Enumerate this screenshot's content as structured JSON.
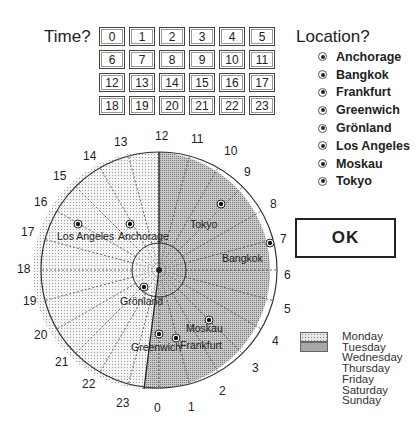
{
  "time": {
    "label": "Time?",
    "hours": [
      "0",
      "1",
      "2",
      "3",
      "4",
      "5",
      "6",
      "7",
      "8",
      "9",
      "10",
      "11",
      "12",
      "13",
      "14",
      "15",
      "16",
      "17",
      "18",
      "19",
      "20",
      "21",
      "22",
      "23"
    ]
  },
  "location": {
    "label": "Location?",
    "options": [
      "Anchorage",
      "Bangkok",
      "Frankfurt",
      "Greenwich",
      "Grönland",
      "Los Angeles",
      "Moskau",
      "Tokyo"
    ]
  },
  "ok_button": {
    "label": "OK"
  },
  "dial": {
    "hour_labels": [
      {
        "text": "12",
        "x": 155,
        "y": 140
      },
      {
        "text": "11",
        "x": 191,
        "y": 143
      },
      {
        "text": "10",
        "x": 224,
        "y": 155
      },
      {
        "text": "9",
        "x": 244,
        "y": 176
      },
      {
        "text": "8",
        "x": 270,
        "y": 208
      },
      {
        "text": "7",
        "x": 280,
        "y": 243
      },
      {
        "text": "6",
        "x": 284,
        "y": 279
      },
      {
        "text": "5",
        "x": 284,
        "y": 313
      },
      {
        "text": "4",
        "x": 272,
        "y": 345
      },
      {
        "text": "3",
        "x": 252,
        "y": 372
      },
      {
        "text": "2",
        "x": 219,
        "y": 395
      },
      {
        "text": "1",
        "x": 188,
        "y": 411
      },
      {
        "text": "0",
        "x": 154,
        "y": 412
      },
      {
        "text": "23",
        "x": 116,
        "y": 407
      },
      {
        "text": "22",
        "x": 82,
        "y": 388
      },
      {
        "text": "21",
        "x": 55,
        "y": 366
      },
      {
        "text": "20",
        "x": 34,
        "y": 339
      },
      {
        "text": "19",
        "x": 23,
        "y": 305
      },
      {
        "text": "18",
        "x": 17,
        "y": 273
      },
      {
        "text": "17",
        "x": 21,
        "y": 236
      },
      {
        "text": "16",
        "x": 34,
        "y": 206
      },
      {
        "text": "15",
        "x": 53,
        "y": 180
      },
      {
        "text": "14",
        "x": 83,
        "y": 160
      },
      {
        "text": "13",
        "x": 114,
        "y": 146
      }
    ],
    "cities": [
      {
        "name": "Los Angeles",
        "mx": 78,
        "my": 224,
        "lx": 57,
        "ly": 240
      },
      {
        "name": "Anchorage",
        "mx": 130,
        "my": 224,
        "lx": 118,
        "ly": 240
      },
      {
        "name": "Tokyo",
        "mx": 221,
        "my": 204,
        "lx": 190,
        "ly": 228
      },
      {
        "name": "Bangkok",
        "mx": 270,
        "my": 243,
        "lx": 222,
        "ly": 262
      },
      {
        "name": "Grönland",
        "mx": 144,
        "my": 287,
        "lx": 120,
        "ly": 305
      },
      {
        "name": "Moskau",
        "mx": 209,
        "my": 320,
        "lx": 186,
        "ly": 332
      },
      {
        "name": "Greenwich",
        "mx": 159,
        "my": 334,
        "lx": 131,
        "ly": 351
      },
      {
        "name": "Frankfurt",
        "mx": 176,
        "my": 338,
        "lx": 180,
        "ly": 349
      }
    ]
  },
  "legend": {
    "swatches": [
      {
        "day": "Monday",
        "color": "#dcdcdc"
      },
      {
        "day": "Tuesday",
        "color": "#9a9a9a"
      }
    ],
    "days": [
      "Monday",
      "Tuesday",
      "Wednesday",
      "Thursday",
      "Friday",
      "Saturday",
      "Sunday"
    ]
  },
  "colors": {
    "monday_fill": "#ececec",
    "tuesday_fill": "#b8b8b8",
    "line": "#333333"
  }
}
